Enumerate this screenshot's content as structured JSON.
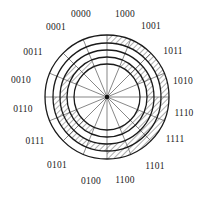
{
  "diagram": {
    "center": [
      107,
      97
    ],
    "outer_radius": 62,
    "ring_radii": [
      62,
      54,
      47,
      40,
      33
    ],
    "sector_count": 16,
    "colors": {
      "line": "#1a1a1a",
      "spoke": "#555555",
      "hatch": "#333333",
      "background": "#ffffff"
    },
    "sectors": [
      {
        "code": "0000",
        "label_pos": [
          81,
          14
        ]
      },
      {
        "code": "1000",
        "label_pos": [
          125,
          14
        ]
      },
      {
        "code": "1001",
        "label_pos": [
          151,
          26
        ]
      },
      {
        "code": "1011",
        "label_pos": [
          173,
          51
        ]
      },
      {
        "code": "1010",
        "label_pos": [
          183,
          81
        ]
      },
      {
        "code": "1110",
        "label_pos": [
          184,
          113
        ]
      },
      {
        "code": "1111",
        "label_pos": [
          175,
          139
        ]
      },
      {
        "code": "1101",
        "label_pos": [
          155,
          166
        ]
      },
      {
        "code": "1100",
        "label_pos": [
          125,
          180
        ]
      },
      {
        "code": "0100",
        "label_pos": [
          91,
          181
        ]
      },
      {
        "code": "0101",
        "label_pos": [
          57,
          165
        ]
      },
      {
        "code": "0111",
        "label_pos": [
          35,
          141
        ]
      },
      {
        "code": "0110",
        "label_pos": [
          23,
          109
        ]
      },
      {
        "code": "0010",
        "label_pos": [
          21,
          80
        ]
      },
      {
        "code": "0011",
        "label_pos": [
          33,
          52
        ]
      },
      {
        "code": "0001",
        "label_pos": [
          56,
          27
        ]
      }
    ]
  }
}
